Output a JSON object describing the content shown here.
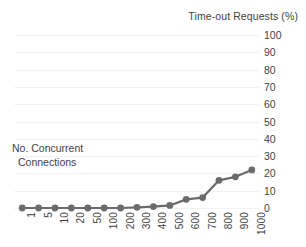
{
  "chart_data": {
    "type": "line",
    "title": "Time-out Requests (%)",
    "xlabel": "No. Concurrent Connections",
    "ylabel": "Time-out Requests (%)",
    "categories": [
      "1",
      "5",
      "10",
      "20",
      "50",
      "100",
      "200",
      "300",
      "400",
      "500",
      "600",
      "700",
      "800",
      "900",
      "1000"
    ],
    "values": [
      0,
      0,
      0,
      0,
      0,
      0,
      0,
      0.4,
      0.8,
      1.5,
      5,
      6,
      16,
      18,
      22
    ],
    "ylim": [
      0,
      100
    ],
    "y_ticks": [
      0,
      10,
      20,
      30,
      40,
      50,
      60,
      70,
      80,
      90,
      100
    ],
    "grid": true,
    "legend": false,
    "legend_position": "none",
    "series": [
      {
        "name": "Time-out Requests (%)",
        "values": [
          0,
          0,
          0,
          0,
          0,
          0,
          0,
          0.4,
          0.8,
          1.5,
          5,
          6,
          16,
          18,
          22
        ],
        "color": "#6b6b6b",
        "marker": "circle"
      }
    ],
    "annotations": [
      {
        "text_line1": "No. Concurrent",
        "text_line2": "Connections"
      }
    ]
  },
  "colors": {
    "series": "#6b6b6b",
    "gridline": "#f2f2f2",
    "text": "#3f3f3f",
    "background": "#ffffff"
  },
  "title": "Time-out Requests (%)",
  "axis_annotation": {
    "line1": "No. Concurrent",
    "line2": "Connections"
  },
  "y_labels": [
    "100",
    "90",
    "80",
    "70",
    "60",
    "50",
    "40",
    "30",
    "20",
    "10",
    "0"
  ],
  "x_labels": [
    "1",
    "5",
    "10",
    "20",
    "50",
    "100",
    "200",
    "300",
    "400",
    "500",
    "600",
    "700",
    "800",
    "900",
    "1000"
  ]
}
